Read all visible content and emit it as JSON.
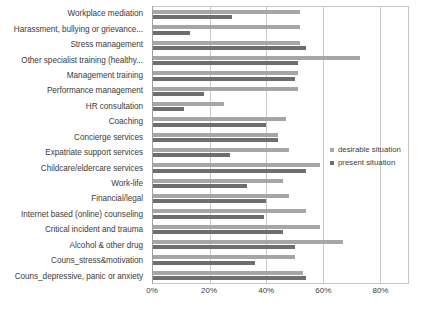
{
  "chart_data": {
    "type": "bar",
    "orientation": "horizontal",
    "title": "",
    "xlabel": "",
    "ylabel": "",
    "xlim": [
      0,
      90
    ],
    "xticks": [
      "0%",
      "20%",
      "40%",
      "60%",
      "80%"
    ],
    "xtick_values": [
      0,
      20,
      40,
      60,
      80
    ],
    "grid": true,
    "legend_position": "right",
    "categories": [
      "Workplace mediation",
      "Harassment, bullying or grievance...",
      "Stress management",
      "Other specialist training (healthy...",
      "Management training",
      "Performance management",
      "HR consultation",
      "Coaching",
      "Concierge services",
      "Expatriate support services",
      "Childcare/eldercare services",
      "Work-life",
      "Financial/legal",
      "Internet based (online) counseling",
      "Critical incident and trauma",
      "Alcohol & other drug",
      "Couns_stress&motivation",
      "Couns_depressive, panic or anxiety"
    ],
    "series": [
      {
        "name": "desirable situation",
        "color": "#a6a6a6",
        "values": [
          52,
          52,
          52,
          73,
          51,
          51,
          25,
          47,
          44,
          48,
          59,
          46,
          48,
          54,
          59,
          67,
          50,
          53
        ]
      },
      {
        "name": "present situation",
        "color": "#6e6e6e",
        "values": [
          28,
          13,
          54,
          51,
          50,
          18,
          11,
          40,
          44,
          27,
          54,
          33,
          40,
          39,
          46,
          50,
          36,
          54
        ]
      }
    ]
  },
  "legend": {
    "items": [
      {
        "label": "desirable situation",
        "color": "#a6a6a6"
      },
      {
        "label": "present situation",
        "color": "#6e6e6e"
      }
    ]
  }
}
